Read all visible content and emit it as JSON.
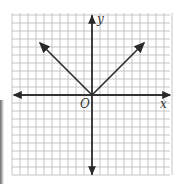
{
  "chart_data": {
    "type": "line",
    "title": "",
    "function": "y = |x|",
    "xlabel": "x",
    "ylabel": "y",
    "origin_label": "O",
    "xlim": [
      -10,
      10
    ],
    "ylim": [
      -10,
      10
    ],
    "grid": true,
    "grid_step": 1,
    "legend": null,
    "series": [
      {
        "name": "left ray",
        "x": [
          0,
          -6.5
        ],
        "y": [
          0,
          6.5
        ],
        "arrow_end": true
      },
      {
        "name": "right ray",
        "x": [
          0,
          6.5
        ],
        "y": [
          0,
          6.5
        ],
        "arrow_end": true
      }
    ]
  },
  "labels": {
    "x_axis": "x",
    "y_axis": "y",
    "origin": "O"
  },
  "colors": {
    "grid": "#b8b8b8",
    "axis": "#2a2a2a",
    "curve": "#2a2a2a",
    "background": "#ffffff"
  }
}
